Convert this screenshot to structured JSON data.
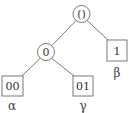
{
  "tree": {
    "nodes": [
      {
        "id": "root",
        "shape": "circle",
        "text": "()",
        "cx": 81.5,
        "cy": 14,
        "r": 8.5
      },
      {
        "id": "n0",
        "shape": "circle",
        "text": "0",
        "cx": 46,
        "cy": 52,
        "r": 8.5
      },
      {
        "id": "n1",
        "shape": "box",
        "text": "1",
        "x": 107,
        "y": 40,
        "w": 20,
        "h": 21
      },
      {
        "id": "n00",
        "shape": "box",
        "text": "00",
        "x": 2,
        "y": 76,
        "w": 21,
        "h": 20
      },
      {
        "id": "n01",
        "shape": "box",
        "text": "01",
        "x": 73,
        "y": 76,
        "w": 20,
        "h": 20
      }
    ],
    "edges": [
      {
        "from": "root",
        "to": "n0"
      },
      {
        "from": "root",
        "to": "n1"
      },
      {
        "from": "n0",
        "to": "n00"
      },
      {
        "from": "n0",
        "to": "n01"
      }
    ],
    "leaf_labels": [
      {
        "node": "n1",
        "text": "β",
        "x": 117,
        "y": 73
      },
      {
        "node": "n00",
        "text": "α",
        "x": 12,
        "y": 106
      },
      {
        "node": "n01",
        "text": "γ",
        "x": 83,
        "y": 106
      }
    ]
  }
}
